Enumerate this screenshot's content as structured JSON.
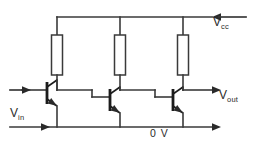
{
  "diagram": {
    "type": "circuit-schematic",
    "background_color": "#ffffff",
    "line_color": "#3a3a3a",
    "labels": {
      "supply": {
        "base": "V",
        "sub": "cc",
        "full": "Vcc"
      },
      "output": {
        "base": "V",
        "sub": "out",
        "full": "Vout"
      },
      "input": {
        "base": "V",
        "sub": "in",
        "full": "Vin"
      },
      "ground": "0 V"
    },
    "nets": [
      {
        "name": "vcc-rail",
        "role": "positive supply rail"
      },
      {
        "name": "ground-rail",
        "role": "zero volt rail"
      }
    ],
    "components": [
      {
        "id": "R1",
        "type": "resistor",
        "role": "collector load stage 1"
      },
      {
        "id": "R2",
        "type": "resistor",
        "role": "collector load stage 2"
      },
      {
        "id": "R3",
        "type": "resistor",
        "role": "collector load stage 3"
      },
      {
        "id": "Q1",
        "type": "npn-transistor",
        "role": "stage 1 common emitter"
      },
      {
        "id": "Q2",
        "type": "npn-transistor",
        "role": "stage 2 common emitter"
      },
      {
        "id": "Q3",
        "type": "npn-transistor",
        "role": "stage 3 common emitter"
      }
    ],
    "terminals": [
      {
        "id": "vcc-terminal",
        "direction": "in",
        "arrow": "left"
      },
      {
        "id": "vin-upper-terminal",
        "direction": "in",
        "arrow": "right"
      },
      {
        "id": "vin-lower-terminal",
        "direction": "in",
        "arrow": "right"
      },
      {
        "id": "vout-terminal",
        "direction": "out",
        "arrow": "right"
      },
      {
        "id": "ground-terminal",
        "direction": "out",
        "arrow": "right"
      }
    ]
  }
}
